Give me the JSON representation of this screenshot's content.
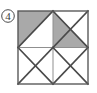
{
  "figure": {
    "label": "4",
    "label_style": "circled-number",
    "label_icon_name": "circled-number-icon",
    "caption": "Square divided into four quadrants with diagonals and shaded triangles",
    "colors": {
      "shade": "#a9a9a9",
      "stroke": "#4a4a4a",
      "thin_stroke": "#8a8a8a",
      "background": "#ffffff",
      "label": "#3a3a3a"
    },
    "geometry": {
      "square": {
        "x": 18,
        "y": 11,
        "width": 70,
        "height": 73
      },
      "midpoint_x": 53,
      "midpoint_y": 47.5,
      "label_circle": {
        "cx": 8,
        "cy": 16,
        "r": 6.5
      }
    },
    "quadrants": [
      {
        "name": "top-left",
        "diagonals": "anti-diagonal",
        "shaded_regions": [
          "upper-left-triangle"
        ]
      },
      {
        "name": "top-right",
        "diagonals": "both",
        "shaded_regions": [
          "left-triangle",
          "bottom-triangle"
        ]
      },
      {
        "name": "bottom-left",
        "diagonals": "both",
        "shaded_regions": []
      },
      {
        "name": "bottom-right",
        "diagonals": "both",
        "shaded_regions": []
      }
    ]
  }
}
